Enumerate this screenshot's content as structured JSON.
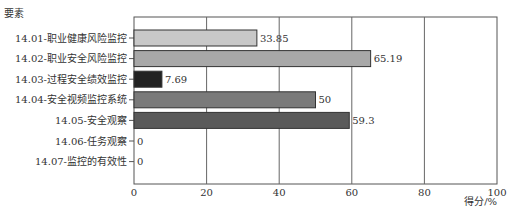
{
  "chart_data": {
    "type": "bar",
    "orientation": "horizontal",
    "title": "",
    "ylabel": "要素",
    "xlabel": "得分/%",
    "xlim": [
      0,
      100
    ],
    "xticks": [
      0,
      20,
      40,
      60,
      80,
      100
    ],
    "grid": true,
    "legend": null,
    "categories": [
      "14.01-职业健康风险监控",
      "14.02-职业安全风险监控",
      "14.03-过程安全绩效监控",
      "14.04-安全视频监控系统",
      "14.05-安全观察",
      "14.06-任务观察",
      "14.07-监控的有效性"
    ],
    "values": [
      33.85,
      65.19,
      7.69,
      50,
      59.3,
      0,
      0
    ],
    "value_labels": [
      "33.85",
      "65.19",
      "7.69",
      "50",
      "59.3",
      "0",
      "0"
    ],
    "bar_colors": [
      "#c8c8c8",
      "#a8a8a8",
      "#222222",
      "#7a7a7a",
      "#5a5a5a",
      "#888888",
      "#888888"
    ]
  }
}
